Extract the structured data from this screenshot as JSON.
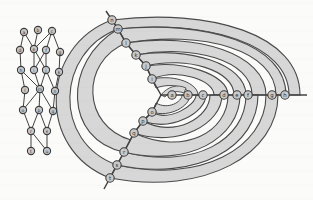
{
  "figure": {
    "background_color": "#fbfbfa",
    "node_fill": "#c9c9c9",
    "node_stroke": "#3b3b3b",
    "edge_color": "#434343",
    "band_fill": "#d7d7d7",
    "band_stroke": "#4a4a4a",
    "label_color": "#2a2a2a"
  },
  "left_graph": {
    "name": "layered-dag",
    "node_radius": 3.6,
    "nodes": [
      {
        "id": "a",
        "label": "a",
        "x": 24,
        "y": 32
      },
      {
        "id": "b",
        "label": "b",
        "x": 38,
        "y": 30
      },
      {
        "id": "c",
        "label": "c",
        "x": 52,
        "y": 31
      },
      {
        "id": "d",
        "label": "d",
        "x": 20,
        "y": 50
      },
      {
        "id": "e",
        "label": "e",
        "x": 34,
        "y": 49
      },
      {
        "id": "f",
        "label": "f",
        "x": 46,
        "y": 50
      },
      {
        "id": "g",
        "label": "g",
        "x": 60,
        "y": 52
      },
      {
        "id": "h",
        "label": "h",
        "x": 21,
        "y": 70
      },
      {
        "id": "i",
        "label": "i",
        "x": 34,
        "y": 70
      },
      {
        "id": "j",
        "label": "j",
        "x": 46,
        "y": 70
      },
      {
        "id": "k",
        "label": "k",
        "x": 59,
        "y": 72
      },
      {
        "id": "l",
        "label": "l",
        "x": 25,
        "y": 90
      },
      {
        "id": "m",
        "label": "m",
        "x": 40,
        "y": 89
      },
      {
        "id": "n",
        "label": "n",
        "x": 55,
        "y": 91
      },
      {
        "id": "o",
        "label": "o",
        "x": 23,
        "y": 110
      },
      {
        "id": "p",
        "label": "p",
        "x": 39,
        "y": 110
      },
      {
        "id": "q",
        "label": "q",
        "x": 53,
        "y": 111
      },
      {
        "id": "r",
        "label": "r",
        "x": 31,
        "y": 131
      },
      {
        "id": "s",
        "label": "s",
        "x": 47,
        "y": 131
      },
      {
        "id": "t",
        "label": "t",
        "x": 31,
        "y": 151
      },
      {
        "id": "u",
        "label": "u",
        "x": 47,
        "y": 151
      }
    ],
    "edges": [
      [
        "a",
        "d"
      ],
      [
        "a",
        "e"
      ],
      [
        "b",
        "e"
      ],
      [
        "c",
        "e"
      ],
      [
        "c",
        "f"
      ],
      [
        "c",
        "g"
      ],
      [
        "d",
        "h"
      ],
      [
        "e",
        "i"
      ],
      [
        "e",
        "j"
      ],
      [
        "f",
        "i"
      ],
      [
        "f",
        "j"
      ],
      [
        "g",
        "k"
      ],
      [
        "h",
        "l"
      ],
      [
        "i",
        "m"
      ],
      [
        "j",
        "m"
      ],
      [
        "h",
        "m"
      ],
      [
        "k",
        "n"
      ],
      [
        "j",
        "n"
      ],
      [
        "l",
        "o"
      ],
      [
        "m",
        "o"
      ],
      [
        "m",
        "p"
      ],
      [
        "m",
        "q"
      ],
      [
        "n",
        "q"
      ],
      [
        "o",
        "r"
      ],
      [
        "p",
        "r"
      ],
      [
        "p",
        "s"
      ],
      [
        "q",
        "s"
      ],
      [
        "r",
        "t"
      ],
      [
        "r",
        "u"
      ],
      [
        "s",
        "u"
      ]
    ]
  },
  "right_graph": {
    "name": "radial-arc-drawing",
    "node_radius": 4.2,
    "spine_nodes": [
      {
        "id": "a",
        "label": "a",
        "x": 172,
        "y": 95
      },
      {
        "id": "b",
        "label": "b",
        "x": 188,
        "y": 95
      },
      {
        "id": "c",
        "label": "c",
        "x": 203,
        "y": 95
      },
      {
        "id": "d",
        "label": "d",
        "x": 224,
        "y": 95
      },
      {
        "id": "e",
        "label": "e",
        "x": 237,
        "y": 95
      },
      {
        "id": "f",
        "label": "f",
        "x": 248,
        "y": 95
      },
      {
        "id": "g",
        "label": "g",
        "x": 272,
        "y": 95
      },
      {
        "id": "h",
        "label": "h",
        "x": 285,
        "y": 95
      }
    ],
    "upper_chain_nodes": [
      {
        "id": "u1",
        "label": "i",
        "x": 152,
        "y": 79
      },
      {
        "id": "u2",
        "label": "j",
        "x": 146,
        "y": 66
      },
      {
        "id": "u3",
        "label": "k",
        "x": 136,
        "y": 55
      },
      {
        "id": "u4",
        "label": "l",
        "x": 126,
        "y": 43
      },
      {
        "id": "u5",
        "label": "m",
        "x": 118,
        "y": 29
      },
      {
        "id": "u6",
        "label": "n",
        "x": 112,
        "y": 20
      }
    ],
    "lower_chain_nodes": [
      {
        "id": "d1",
        "label": "o",
        "x": 152,
        "y": 112
      },
      {
        "id": "d2",
        "label": "p",
        "x": 143,
        "y": 121
      },
      {
        "id": "d3",
        "label": "q",
        "x": 134,
        "y": 133
      },
      {
        "id": "d4",
        "label": "r",
        "x": 124,
        "y": 152
      },
      {
        "id": "d5",
        "label": "s",
        "x": 117,
        "y": 165
      },
      {
        "id": "d6",
        "label": "t",
        "x": 110,
        "y": 178
      }
    ],
    "hub": {
      "x": 161,
      "y": 95
    },
    "arc_band_count": 8,
    "spine_label": "horizontal spine",
    "axis_extent": {
      "x_start": 161,
      "x_end": 305,
      "y": 95
    }
  }
}
